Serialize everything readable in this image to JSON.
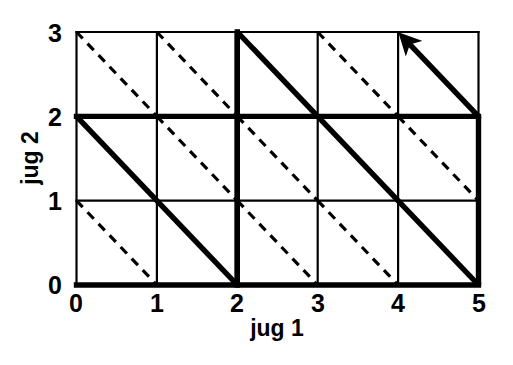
{
  "chart_data": {
    "type": "line",
    "title": "",
    "xlabel": "jug 1",
    "ylabel": "jug 2",
    "xlim": [
      0,
      5
    ],
    "ylim": [
      0,
      3
    ],
    "xticks": [
      0,
      1,
      2,
      3,
      4,
      5
    ],
    "yticks": [
      0,
      1,
      2,
      3
    ],
    "xtick_labels": [
      "0",
      "1",
      "2",
      "3",
      "4",
      "5"
    ],
    "ytick_labels": [
      "0",
      "1",
      "2",
      "3"
    ],
    "grid": true,
    "legend": null,
    "series": [
      {
        "name": "solution path",
        "style": "bold-solid",
        "color": "#000000",
        "linewidth": 5,
        "arrow_at_end": true,
        "points": [
          [
            0,
            2
          ],
          [
            2,
            0
          ],
          [
            2,
            3
          ],
          [
            3,
            2
          ],
          [
            5,
            0
          ],
          [
            5,
            2
          ],
          [
            4,
            3
          ]
        ]
      },
      {
        "name": "bold grid edges",
        "style": "bold-solid",
        "color": "#000000",
        "linewidth": 5,
        "segments": [
          [
            [
              0,
              0
            ],
            [
              5,
              0
            ]
          ],
          [
            [
              0,
              2
            ],
            [
              5,
              2
            ]
          ],
          [
            [
              2,
              0
            ],
            [
              2,
              3
            ]
          ]
        ]
      },
      {
        "name": "thin grid lines",
        "style": "thin-solid",
        "color": "#000000",
        "linewidth": 2,
        "segments": [
          [
            [
              0,
              0
            ],
            [
              0,
              3
            ]
          ],
          [
            [
              1,
              0
            ],
            [
              1,
              3
            ]
          ],
          [
            [
              3,
              0
            ],
            [
              3,
              3
            ]
          ],
          [
            [
              4,
              0
            ],
            [
              4,
              3
            ]
          ],
          [
            [
              5,
              0
            ],
            [
              5,
              3
            ]
          ],
          [
            [
              0,
              1
            ],
            [
              5,
              1
            ]
          ],
          [
            [
              0,
              3
            ],
            [
              5,
              3
            ]
          ]
        ]
      },
      {
        "name": "dashed diagonals",
        "style": "dashed",
        "color": "#000000",
        "linewidth": 3,
        "segments": [
          [
            [
              0,
              3
            ],
            [
              1,
              2
            ]
          ],
          [
            [
              1,
              3
            ],
            [
              2,
              2
            ]
          ],
          [
            [
              3,
              3
            ],
            [
              4,
              2
            ]
          ],
          [
            [
              1,
              2
            ],
            [
              2,
              1
            ]
          ],
          [
            [
              2,
              2
            ],
            [
              3,
              1
            ]
          ],
          [
            [
              4,
              2
            ],
            [
              5,
              1
            ]
          ],
          [
            [
              0,
              1
            ],
            [
              1,
              0
            ]
          ],
          [
            [
              2,
              1
            ],
            [
              3,
              0
            ]
          ],
          [
            [
              3,
              1
            ],
            [
              4,
              0
            ]
          ]
        ]
      }
    ],
    "annotations": [
      {
        "name": "goal-arrow",
        "from": [
          5,
          2
        ],
        "to": [
          4,
          3
        ],
        "direction": "up-left"
      }
    ]
  },
  "axes": {
    "xlabel": "jug 1",
    "ylabel": "jug 2",
    "xticks": [
      "0",
      "1",
      "2",
      "3",
      "4",
      "5"
    ],
    "yticks": [
      "0",
      "1",
      "2",
      "3"
    ]
  },
  "colors": {
    "line": "#000000",
    "background": "#ffffff"
  }
}
